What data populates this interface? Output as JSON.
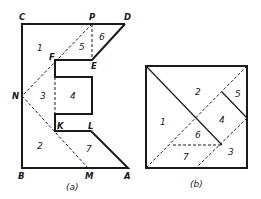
{
  "figure_a": {
    "caption": "(a)",
    "points": {
      "C": "C",
      "P": "P",
      "D": "D",
      "F": "F",
      "E": "E",
      "N": "N",
      "K": "K",
      "L": "L",
      "B": "B",
      "M": "M",
      "A": "A"
    },
    "pieces": [
      "1",
      "2",
      "3",
      "4",
      "5",
      "6",
      "7"
    ]
  },
  "figure_b": {
    "caption": "(b)",
    "pieces": [
      "1",
      "2",
      "3",
      "4",
      "5",
      "6",
      "7"
    ]
  },
  "colors": {
    "ink": "#1a1a1a",
    "background": "#ffffff"
  }
}
